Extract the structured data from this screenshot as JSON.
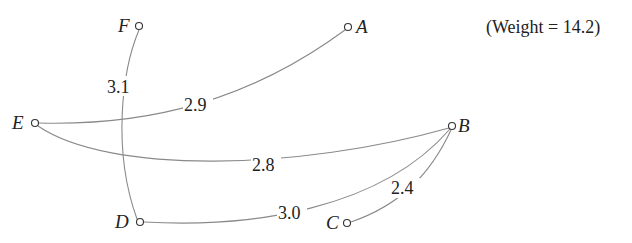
{
  "total_weight_text": "(Weight = 14.2)",
  "nodes": [
    {
      "id": "F",
      "label": "F"
    },
    {
      "id": "A",
      "label": "A"
    },
    {
      "id": "E",
      "label": "E"
    },
    {
      "id": "B",
      "label": "B"
    },
    {
      "id": "D",
      "label": "D"
    },
    {
      "id": "C",
      "label": "C"
    }
  ],
  "edges": [
    {
      "from": "F",
      "to": "D",
      "weight": "3.1"
    },
    {
      "from": "E",
      "to": "A",
      "weight": "2.9"
    },
    {
      "from": "E",
      "to": "B",
      "weight": "2.8"
    },
    {
      "from": "D",
      "to": "B",
      "weight": "3.0"
    },
    {
      "from": "C",
      "to": "B",
      "weight": "2.4"
    }
  ],
  "colors": {
    "edge": "#8a8a8a",
    "node_stroke": "#333333",
    "text": "#222222"
  }
}
